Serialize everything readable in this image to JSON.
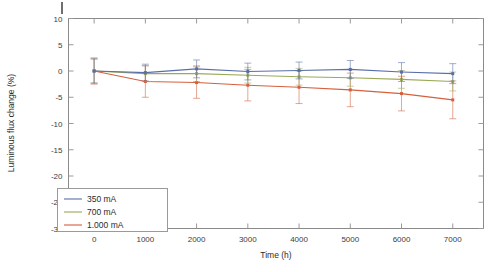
{
  "chart_data": {
    "type": "line",
    "title": "",
    "xlabel": "Time (h)",
    "ylabel": "Luminous flux change (%)",
    "x": [
      0,
      1000,
      2000,
      3000,
      4000,
      5000,
      6000,
      7000
    ],
    "xlim": [
      -500,
      7600
    ],
    "ylim": [
      -30,
      10
    ],
    "xticks": [
      0,
      1000,
      2000,
      3000,
      4000,
      5000,
      6000,
      7000
    ],
    "xticklabels": [
      "0",
      "1000",
      "2000",
      "3000",
      "4000",
      "5000",
      "6000",
      "7000"
    ],
    "yticks": [
      10,
      5,
      0,
      -5,
      -10,
      -15,
      -20,
      -25,
      -30
    ],
    "yticklabels": [
      "10",
      "5",
      "0",
      "-5",
      "-10",
      "-15",
      "-20",
      "-25",
      "-30"
    ],
    "grid": false,
    "legend_position": "lower left",
    "error_bars": true,
    "marker": "square",
    "series": [
      {
        "name": "350 mA",
        "color": "#5a6fa8",
        "values": [
          0.0,
          -0.3,
          0.4,
          -0.1,
          0.1,
          0.3,
          -0.2,
          -0.5
        ],
        "err_lo": [
          2.3,
          1.6,
          1.7,
          1.6,
          1.6,
          1.7,
          1.8,
          1.9
        ],
        "err_hi": [
          2.3,
          1.6,
          1.7,
          1.6,
          1.6,
          1.7,
          1.8,
          1.9
        ]
      },
      {
        "name": "700 mA",
        "color": "#9aaa5a",
        "values": [
          0.0,
          -0.5,
          -0.5,
          -0.8,
          -1.1,
          -1.3,
          -1.6,
          -2.0
        ],
        "err_lo": [
          2.3,
          1.5,
          1.5,
          1.5,
          1.6,
          1.6,
          1.7,
          1.8
        ],
        "err_hi": [
          2.3,
          1.5,
          1.5,
          1.5,
          1.6,
          1.6,
          1.7,
          1.8
        ]
      },
      {
        "name": "1.000 mA",
        "color": "#d4603c",
        "values": [
          0.0,
          -2.0,
          -2.2,
          -2.7,
          -3.1,
          -3.6,
          -4.3,
          -5.5
        ],
        "err_lo": [
          2.5,
          3.0,
          3.0,
          3.0,
          3.1,
          3.2,
          3.3,
          3.6
        ],
        "err_hi": [
          2.5,
          3.0,
          3.0,
          3.0,
          3.1,
          3.2,
          3.3,
          3.6
        ]
      }
    ]
  },
  "legend": {
    "entries": [
      {
        "label": "350 mA"
      },
      {
        "label": "700 mA"
      },
      {
        "label": "1.000 mA"
      }
    ]
  },
  "axes": {
    "x_title": "Time (h)",
    "y_title": "Luminous flux change (%)"
  }
}
